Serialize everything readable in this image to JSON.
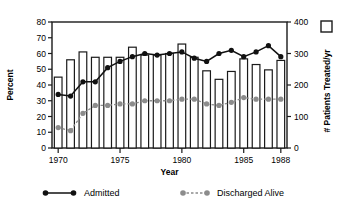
{
  "chart_data": {
    "type": "bar",
    "title": "",
    "xlabel": "Year",
    "ylabel": "Percent",
    "y2label": "# Patients Treated/yr",
    "ylim": [
      0,
      80
    ],
    "y2lim": [
      0,
      400
    ],
    "grid": false,
    "legend_position": "bottom",
    "categories": [
      1970,
      1971,
      1972,
      1973,
      1974,
      1975,
      1976,
      1977,
      1978,
      1979,
      1980,
      1981,
      1982,
      1983,
      1984,
      1985,
      1986,
      1987,
      1988
    ],
    "xticks": [
      "1970",
      "1975",
      "1980",
      "1985",
      "1988"
    ],
    "yticks": [
      "0",
      "10",
      "20",
      "30",
      "40",
      "50",
      "60",
      "70",
      "80"
    ],
    "y2ticks": [
      "0",
      "100",
      "200",
      "300",
      "400"
    ],
    "series": [
      {
        "name": "# Patients Treated/yr",
        "marker": "bar",
        "axis": "right",
        "color": "#ffffff",
        "edge": "#1a1a1a",
        "values": [
          225,
          280,
          305,
          288,
          288,
          288,
          320,
          295,
          295,
          300,
          330,
          288,
          245,
          218,
          243,
          283,
          265,
          248,
          278
        ]
      },
      {
        "name": "Admitted",
        "marker": "filled-circle",
        "axis": "left",
        "color": "#111111",
        "linestyle": "solid",
        "values": [
          34,
          33,
          42,
          42,
          51,
          55,
          58,
          60,
          59,
          60,
          61,
          57,
          55,
          60,
          62,
          58,
          61,
          65,
          58
        ]
      },
      {
        "name": "Discharged Alive",
        "marker": "filled-circle",
        "axis": "left",
        "color": "#8c8c8c",
        "linestyle": "dashed",
        "values": [
          13,
          11,
          22,
          27,
          27,
          28,
          28,
          30,
          30,
          30,
          31,
          31,
          28,
          27,
          29,
          32,
          31,
          31,
          31
        ]
      }
    ]
  },
  "legend": {
    "items": [
      {
        "label": "Admitted",
        "style": "solid-black-line-with-dots"
      },
      {
        "label": "Discharged Alive",
        "style": "dashed-gray-line-with-dots"
      }
    ]
  },
  "right_axis_legend": {
    "label": "# Patients Treated/yr",
    "marker": "open-square"
  }
}
